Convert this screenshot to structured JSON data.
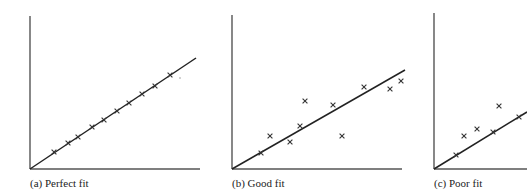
{
  "panels": [
    {
      "id": "a",
      "caption": "(a) Perfect fit",
      "origin": [
        30,
        169
      ],
      "yaxis_top": [
        30,
        16
      ],
      "xaxis_end": [
        200,
        169
      ],
      "line_end": [
        196,
        58
      ],
      "points": [
        [
          54,
          152
        ],
        [
          68,
          143
        ],
        [
          78,
          137
        ],
        [
          92,
          127
        ],
        [
          104,
          120
        ],
        [
          117,
          111
        ],
        [
          129,
          103
        ],
        [
          142,
          94
        ],
        [
          155,
          86
        ],
        [
          170,
          75
        ]
      ],
      "stray_marks": [
        [
          180,
          78
        ]
      ]
    },
    {
      "id": "b",
      "caption": "(b) Good fit",
      "origin": [
        232,
        169
      ],
      "yaxis_top": [
        232,
        15
      ],
      "xaxis_end": [
        402,
        169
      ],
      "line_end": [
        405,
        70
      ],
      "points": [
        [
          261,
          153
        ],
        [
          270,
          136
        ],
        [
          290,
          142
        ],
        [
          300,
          126
        ],
        [
          305,
          101
        ],
        [
          333,
          105
        ],
        [
          342,
          136
        ],
        [
          364,
          87
        ],
        [
          390,
          89
        ],
        [
          401,
          81
        ]
      ]
    },
    {
      "id": "c",
      "caption": "(c) Poor fit",
      "origin": [
        434,
        169
      ],
      "yaxis_top": [
        434,
        13
      ],
      "xaxis_end": [
        527,
        169
      ],
      "line_end": [
        527,
        112
      ],
      "points": [
        [
          456,
          155
        ],
        [
          464,
          136
        ],
        [
          477,
          129
        ],
        [
          493,
          132
        ],
        [
          499,
          106
        ],
        [
          519,
          117
        ]
      ]
    }
  ],
  "marker": "x",
  "colors": {
    "axis": "#555555",
    "line": "#222222",
    "marker": "#333333"
  }
}
